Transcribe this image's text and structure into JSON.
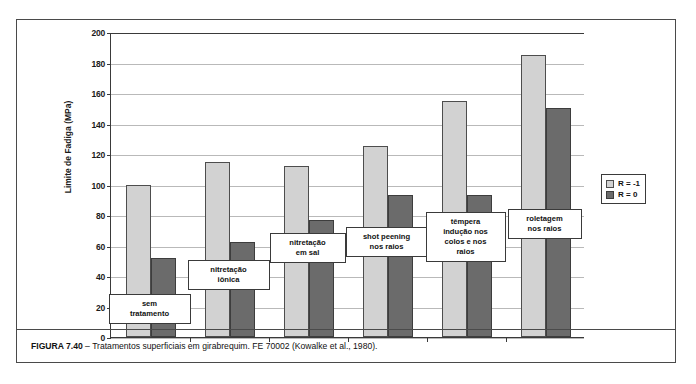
{
  "figure": {
    "caption_label": "FIGURA 7.40",
    "caption_dash": " – ",
    "caption_text": "Tratamentos superficiais em girabrequim. FE 70002 (Kowalke et al., 1980)."
  },
  "legend": {
    "position": "right",
    "items": [
      {
        "label": "R = -1",
        "color": "#d2d2d2",
        "style": "light"
      },
      {
        "label": "R = 0",
        "color": "#6b6b6b",
        "style": "dark"
      }
    ]
  },
  "chart_data": {
    "type": "bar",
    "title": "",
    "xlabel": "",
    "ylabel": "Limite de Fadiga (MPa)",
    "ylim": [
      0,
      200
    ],
    "ytick_step": 20,
    "yticks": [
      0,
      20,
      40,
      60,
      80,
      100,
      120,
      140,
      160,
      180,
      200
    ],
    "grid": true,
    "grid_axis": "y",
    "legend_position": "right",
    "categories": [
      "sem\ntratamento",
      "nitretação\niônica",
      "nitretação\nem sal",
      "shot peening\nnos raios",
      "têmpera\nindução nos\ncolos e nos\nraios",
      "roletagem\nnos raios"
    ],
    "series": [
      {
        "name": "R = -1",
        "color": "#d2d2d2",
        "values": [
          100,
          115,
          112,
          125,
          155,
          185
        ]
      },
      {
        "name": "R = 0",
        "color": "#6b6b6b",
        "values": [
          52,
          62,
          77,
          93,
          93,
          150
        ]
      }
    ]
  }
}
